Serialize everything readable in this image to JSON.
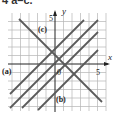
{
  "heading": "4 a–c.",
  "graph": {
    "x_axis_label": "x",
    "y_axis_label": "y",
    "x_tick_label": "5",
    "y_tick_label": "5",
    "origin_label": "0",
    "grid_range": [
      -6,
      6
    ],
    "lines": [
      {
        "label": "(a)",
        "slope": 1,
        "intercept": -3
      },
      {
        "label": "",
        "slope": 1,
        "intercept": 0
      },
      {
        "label": "(c)",
        "slope": 1,
        "intercept": 3
      },
      {
        "label": "(b)",
        "slope": -1,
        "intercept": 1
      }
    ],
    "labels": {
      "a": "(a)",
      "b": "(b)",
      "c": "(c)"
    },
    "colors": {
      "grid": "#b0b0b0",
      "line": "#555555",
      "axis": "#222222"
    }
  }
}
